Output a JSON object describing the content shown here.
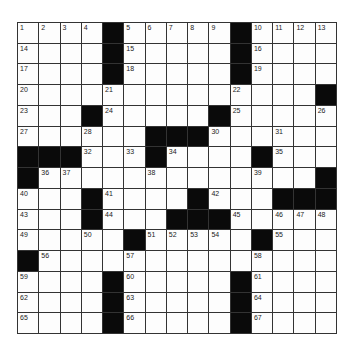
{
  "puzzle": {
    "rows": 15,
    "cols": 15,
    "layout": [
      "....#.....#....",
      "....#.....#....",
      "....#.....#....",
      "..............#",
      "...#.....#.....",
      "......###......",
      "###...#....#...",
      "#.............#",
      "...#....#...###",
      "...#...###.....",
      ".....#.....#...",
      "#..............",
      "....#.....#....",
      "....#.....#....",
      "....#.....#...."
    ],
    "numbers": [
      [
        1,
        2,
        3,
        4,
        null,
        5,
        6,
        7,
        8,
        9,
        null,
        10,
        11,
        12,
        13
      ],
      [
        14,
        null,
        null,
        null,
        null,
        15,
        null,
        null,
        null,
        null,
        null,
        16,
        null,
        null,
        null
      ],
      [
        17,
        null,
        null,
        null,
        null,
        18,
        null,
        null,
        null,
        null,
        null,
        19,
        null,
        null,
        null
      ],
      [
        20,
        null,
        null,
        null,
        21,
        null,
        null,
        null,
        null,
        null,
        22,
        null,
        null,
        null,
        null
      ],
      [
        23,
        null,
        null,
        null,
        24,
        null,
        null,
        null,
        null,
        null,
        25,
        null,
        null,
        null,
        26
      ],
      [
        27,
        null,
        null,
        28,
        null,
        null,
        null,
        null,
        29,
        30,
        null,
        null,
        31,
        null,
        null
      ],
      [
        null,
        null,
        null,
        32,
        null,
        33,
        null,
        34,
        null,
        null,
        null,
        null,
        35,
        null,
        null
      ],
      [
        null,
        36,
        37,
        null,
        null,
        null,
        38,
        null,
        null,
        null,
        null,
        39,
        null,
        null,
        null
      ],
      [
        40,
        null,
        null,
        null,
        41,
        null,
        null,
        null,
        null,
        42,
        null,
        null,
        null,
        null,
        null
      ],
      [
        43,
        null,
        null,
        null,
        44,
        null,
        null,
        null,
        null,
        null,
        45,
        null,
        46,
        47,
        48
      ],
      [
        49,
        null,
        null,
        50,
        null,
        null,
        51,
        52,
        53,
        54,
        null,
        null,
        55,
        null,
        null
      ],
      [
        null,
        56,
        null,
        null,
        null,
        57,
        null,
        null,
        null,
        null,
        null,
        58,
        null,
        null,
        null
      ],
      [
        59,
        null,
        null,
        null,
        null,
        60,
        null,
        null,
        null,
        null,
        null,
        61,
        null,
        null,
        null
      ],
      [
        62,
        null,
        null,
        null,
        null,
        63,
        null,
        null,
        null,
        null,
        null,
        64,
        null,
        null,
        null
      ],
      [
        65,
        null,
        null,
        null,
        null,
        66,
        null,
        null,
        null,
        null,
        null,
        67,
        null,
        null,
        null
      ]
    ]
  },
  "colors": {
    "block": "#0a0a0a",
    "cell": "#fdfdfd",
    "line": "#333333"
  }
}
